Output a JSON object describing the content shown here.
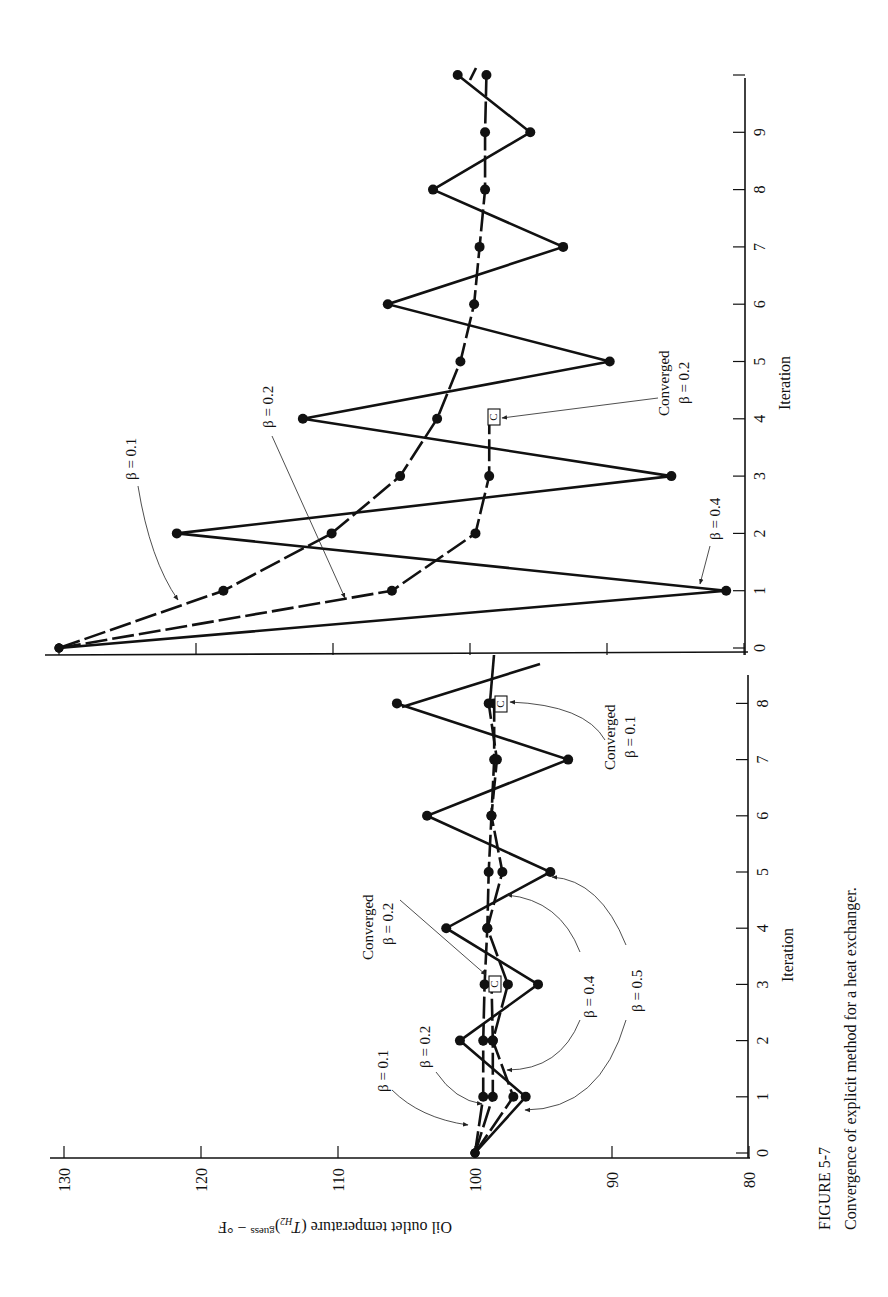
{
  "figure": {
    "number": "FIGURE 5-7",
    "caption": "Convergence of explicit method for a heat exchanger.",
    "orientation": "page rotated 90° counter-clockwise"
  },
  "axes": {
    "ylabel": "Oil outlet temperature (T_H2)^guess − °F",
    "ylabel_main": "Oil outlet temperature (",
    "ylabel_var": "T",
    "ylabel_sub": "H2",
    "ylabel_sup": "guess",
    "ylabel_unit": " − °F",
    "xlabel": "Iteration",
    "temperature_ticks": [
      "130",
      "120",
      "110",
      "100",
      "90",
      "80"
    ]
  },
  "annotations": {
    "converged": "Converged",
    "c_marker": "C",
    "left": {
      "beta_01": "β = 0.1",
      "beta_02": "β = 0.2",
      "beta_04": "β = 0.4",
      "beta_05": "β = 0.5",
      "conv_02_label": "β = 0.2",
      "conv_01_label": "β = 0.1"
    },
    "right": {
      "beta_01": "β = 0.1",
      "beta_02": "β = 0.2",
      "beta_04": "β = 0.4",
      "conv_02_label": "β = 0.2"
    }
  },
  "chart_data": [
    {
      "type": "line",
      "title": "Left panel: initial guess 100 °F",
      "xlabel": "Iteration",
      "ylabel": "Oil outlet temperature (T_H2)^guess − °F",
      "x": [
        0,
        1,
        2,
        3,
        4,
        5,
        6,
        7,
        8
      ],
      "xticks": [
        "0",
        "1",
        "2",
        "3",
        "4",
        "5",
        "6",
        "7",
        "8"
      ],
      "ylim": [
        80,
        130
      ],
      "yticks": [
        80,
        90,
        100,
        110,
        120,
        130
      ],
      "grid": false,
      "series": [
        {
          "name": "β = 0.1",
          "style": "dashed",
          "values": [
            100,
            99.4,
            99.4,
            99.3,
            99.1,
            99.0,
            98.8,
            98.6,
            98.6
          ],
          "converged_at": {
            "iteration": 8,
            "value": 98.2
          }
        },
        {
          "name": "β = 0.2",
          "style": "dashed",
          "values": [
            100,
            98.7,
            98.7
          ],
          "converged_at": {
            "iteration": 3,
            "value": 98.5
          }
        },
        {
          "name": "β = 0.4",
          "style": "dashed",
          "values": [
            100,
            97.2,
            98.7,
            97.6,
            99.1,
            98.0,
            98.8,
            98.4,
            99.0
          ]
        },
        {
          "name": "β = 0.5",
          "style": "solid",
          "values": [
            100,
            96.3,
            101.1,
            95.4,
            102.1,
            94.5,
            103.5,
            93.2,
            105.7
          ]
        }
      ]
    },
    {
      "type": "line",
      "title": "Right panel: initial guess 130 °F",
      "xlabel": "Iteration",
      "ylabel": "Oil outlet temperature (T_H2)^guess − °F",
      "x": [
        0,
        1,
        2,
        3,
        4,
        5,
        6,
        7,
        8,
        9,
        10
      ],
      "xticks": [
        "0",
        "1",
        "2",
        "3",
        "4",
        "5",
        "6",
        "7",
        "8",
        "9",
        ""
      ],
      "ylim": [
        80,
        130
      ],
      "yticks": [
        80,
        90,
        100,
        110,
        120,
        130
      ],
      "grid": false,
      "series": [
        {
          "name": "β = 0.1",
          "style": "dashed",
          "values": [
            130,
            118.0,
            110.1,
            105.1,
            102.4,
            100.7,
            99.7,
            99.3,
            98.9,
            98.9,
            98.8
          ]
        },
        {
          "name": "β = 0.2",
          "style": "dashed",
          "values": [
            130,
            105.7,
            99.6,
            98.6
          ],
          "converged_at": {
            "iteration": 3.9,
            "value": 98.3
          }
        },
        {
          "name": "β = 0.4",
          "style": "solid",
          "values": [
            130,
            81.3,
            121.4,
            85.3,
            112.2,
            89.8,
            106.0,
            93.2,
            102.7,
            95.6,
            100.9
          ]
        }
      ]
    }
  ]
}
